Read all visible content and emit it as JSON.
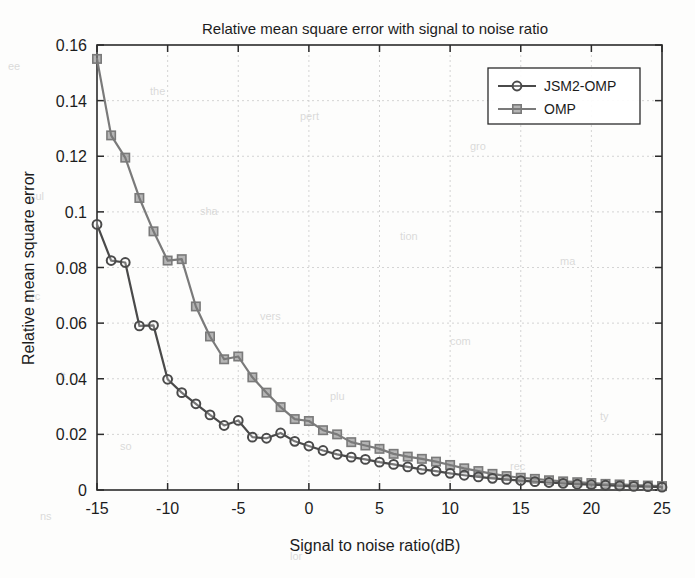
{
  "chart_data": {
    "type": "line",
    "title": "Relative mean square error with signal to noise ratio",
    "xlabel": "Signal to noise ratio(dB)",
    "ylabel": "Relative mean square error",
    "xlim": [
      -15,
      25
    ],
    "ylim": [
      0,
      0.16
    ],
    "grid": true,
    "legend_position": "top-right",
    "xticks": [
      -15,
      -10,
      -5,
      0,
      5,
      10,
      15,
      20,
      25
    ],
    "xtick_labels": [
      "-15",
      "-10",
      "-5",
      "0",
      "5",
      "10",
      "15",
      "20",
      "25"
    ],
    "yticks": [
      0,
      0.02,
      0.04,
      0.06,
      0.08,
      0.1,
      0.12,
      0.14,
      0.16
    ],
    "ytick_labels": [
      "0",
      "0.02",
      "0.04",
      "0.06",
      "0.08",
      "0.1",
      "0.12",
      "0.14",
      "0.16"
    ],
    "x": [
      -15,
      -14,
      -13,
      -12,
      -11,
      -10,
      -9,
      -8,
      -7,
      -6,
      -5,
      -4,
      -3,
      -2,
      -1,
      0,
      1,
      2,
      3,
      4,
      5,
      6,
      7,
      8,
      9,
      10,
      11,
      12,
      13,
      14,
      15,
      16,
      17,
      18,
      19,
      20,
      21,
      22,
      23,
      24,
      25
    ],
    "series": [
      {
        "name": "JSM2-OMP",
        "marker": "circle",
        "color": "#4a4a4a",
        "values": [
          0.0955,
          0.0825,
          0.0818,
          0.059,
          0.0592,
          0.0398,
          0.035,
          0.031,
          0.027,
          0.0232,
          0.025,
          0.019,
          0.0186,
          0.0205,
          0.0175,
          0.0158,
          0.0142,
          0.0128,
          0.0118,
          0.011,
          0.01,
          0.0092,
          0.0083,
          0.0074,
          0.0068,
          0.006,
          0.0053,
          0.0047,
          0.0042,
          0.0038,
          0.0034,
          0.003,
          0.0027,
          0.0024,
          0.0021,
          0.0019,
          0.0017,
          0.0015,
          0.0013,
          0.0012,
          0.001
        ]
      },
      {
        "name": "OMP",
        "marker": "square",
        "color": "#7a7a7a",
        "values": [
          0.155,
          0.1275,
          0.1195,
          0.105,
          0.093,
          0.0825,
          0.083,
          0.066,
          0.0552,
          0.047,
          0.048,
          0.0405,
          0.035,
          0.0298,
          0.0255,
          0.0248,
          0.0215,
          0.02,
          0.0172,
          0.016,
          0.0148,
          0.013,
          0.012,
          0.0112,
          0.0102,
          0.009,
          0.0078,
          0.0068,
          0.0058,
          0.005,
          0.0044,
          0.004,
          0.0035,
          0.0031,
          0.0028,
          0.0025,
          0.0022,
          0.002,
          0.0018,
          0.0016,
          0.0014
        ]
      }
    ]
  },
  "legend": {
    "entries": [
      {
        "label": "JSM2-OMP"
      },
      {
        "label": "OMP"
      }
    ]
  }
}
